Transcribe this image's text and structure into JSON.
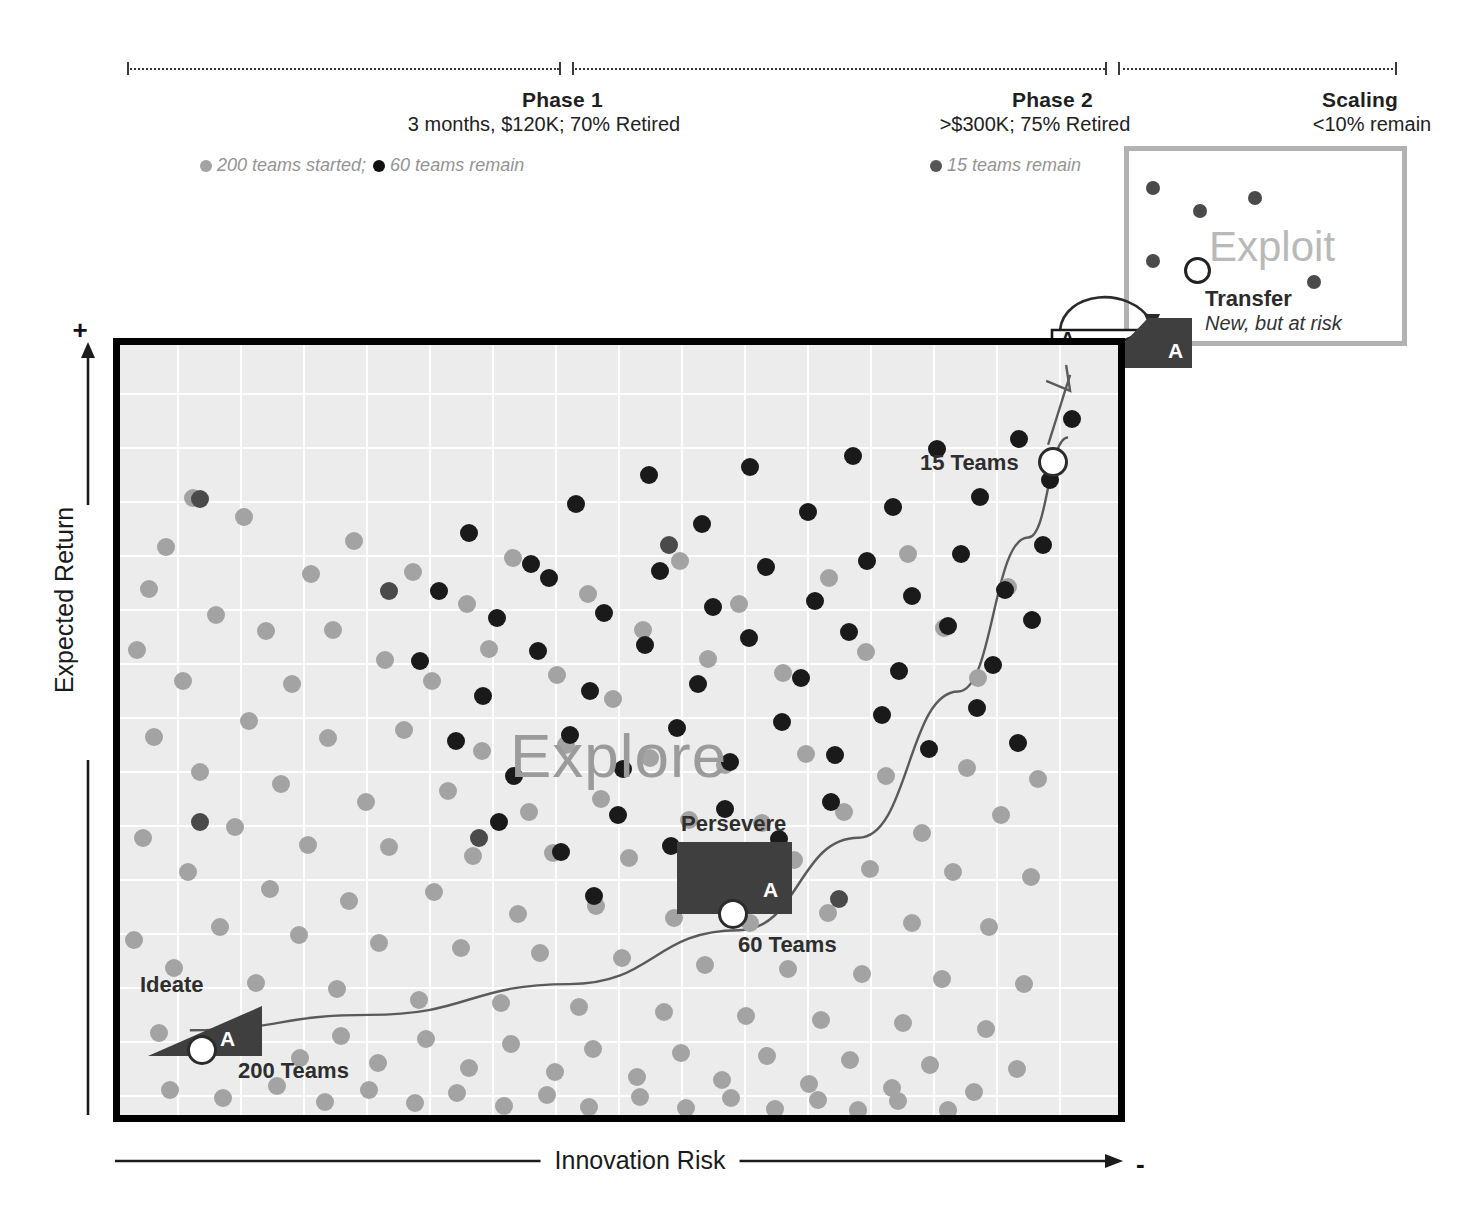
{
  "header": {
    "phases": [
      {
        "id": "phase-1",
        "title": "Phase 1",
        "subtitle": "3 months, $120K; 70% Retired",
        "note_gray": "200 teams started;",
        "note_black": "60 teams remain"
      },
      {
        "id": "phase-2",
        "title": "Phase 2",
        "subtitle": ">$300K; 75% Retired",
        "note_black": "15 teams remain"
      },
      {
        "id": "scaling",
        "title": "Scaling",
        "subtitle": "<10% remain"
      }
    ]
  },
  "axes": {
    "y_label": "Expected Return",
    "y_plus": "+",
    "x_label": "Innovation Risk",
    "x_minus": "-"
  },
  "plot": {
    "watermark": "Explore",
    "stages": [
      {
        "id": "ideate",
        "label": "Ideate",
        "marker_letter": "A",
        "count_label": "200 Teams"
      },
      {
        "id": "persevere",
        "label": "Persevere",
        "marker_letter": "A",
        "count_label": "60 Teams"
      },
      {
        "id": "pivot",
        "label": "15 Teams",
        "marker_letter": "A",
        "count_label": "15 Teams"
      }
    ]
  },
  "exploit_panel": {
    "watermark": "Exploit",
    "transfer_title": "Transfer",
    "transfer_subtitle": "New, but at risk",
    "marker_letter_white": "A",
    "marker_letter_dark": "A"
  },
  "colors": {
    "gray_dot": "#a3a3a3",
    "black_dot": "#1a1a1a",
    "dark_fill": "#3f3f3f",
    "plot_bg": "#ececec",
    "frame": "#000000",
    "panel_border": "#b2b2b2",
    "watermark": "#9b9b9b",
    "muted_text": "#949494"
  },
  "chart_data": {
    "type": "scatter",
    "xlabel": "Innovation Risk",
    "ylabel": "Expected Return",
    "xlim": [
      0,
      100
    ],
    "ylim": [
      0,
      100
    ],
    "grid": true,
    "legend_position": "top",
    "annotations": [
      "Phase 1 — 3 months, $120K; 70% Retired — 200 teams started; 60 teams remain",
      "Phase 2 — >$300K; 75% Retired — 15 teams remain",
      "Scaling — <10% remain",
      "Ideate: 200 Teams",
      "Persevere: 60 Teams",
      "Transfer: 15 Teams (New, but at risk)"
    ],
    "series": [
      {
        "name": "200 teams started",
        "color": "#a3a3a3",
        "count": 141,
        "points": [
          [
            7.3,
            80.1
          ],
          [
            4.6,
            73.8
          ],
          [
            12.4,
            77.7
          ],
          [
            2.9,
            68.3
          ],
          [
            9.6,
            64.9
          ],
          [
            1.7,
            60.4
          ],
          [
            14.6,
            62.9
          ],
          [
            6.3,
            56.4
          ],
          [
            19.1,
            70.3
          ],
          [
            17.2,
            56.0
          ],
          [
            23.4,
            74.6
          ],
          [
            21.3,
            63.0
          ],
          [
            29.4,
            70.5
          ],
          [
            26.6,
            59.1
          ],
          [
            34.8,
            66.4
          ],
          [
            31.3,
            56.3
          ],
          [
            39.4,
            72.3
          ],
          [
            37.0,
            60.5
          ],
          [
            43.8,
            57.1
          ],
          [
            46.9,
            67.6
          ],
          [
            52.4,
            63.0
          ],
          [
            49.4,
            54.0
          ],
          [
            56.1,
            72.0
          ],
          [
            58.9,
            59.2
          ],
          [
            62.0,
            66.3
          ],
          [
            66.4,
            57.4
          ],
          [
            71.0,
            69.7
          ],
          [
            74.7,
            60.1
          ],
          [
            79.0,
            72.8
          ],
          [
            82.6,
            63.3
          ],
          [
            86.0,
            56.7
          ],
          [
            89.0,
            68.6
          ],
          [
            3.4,
            49.1
          ],
          [
            8.0,
            44.6
          ],
          [
            12.9,
            51.2
          ],
          [
            16.1,
            43.0
          ],
          [
            20.8,
            48.9
          ],
          [
            24.6,
            40.6
          ],
          [
            28.5,
            50.0
          ],
          [
            32.9,
            42.1
          ],
          [
            36.3,
            47.3
          ],
          [
            41.0,
            39.4
          ],
          [
            44.7,
            48.1
          ],
          [
            48.2,
            41.0
          ],
          [
            53.1,
            46.4
          ],
          [
            57.0,
            38.3
          ],
          [
            60.6,
            45.5
          ],
          [
            64.3,
            37.9
          ],
          [
            68.7,
            46.9
          ],
          [
            72.5,
            39.4
          ],
          [
            76.8,
            44.0
          ],
          [
            80.4,
            36.6
          ],
          [
            84.9,
            45.1
          ],
          [
            88.3,
            38.9
          ],
          [
            92.0,
            43.7
          ],
          [
            2.3,
            36.0
          ],
          [
            6.8,
            31.5
          ],
          [
            11.5,
            37.4
          ],
          [
            15.0,
            29.4
          ],
          [
            18.8,
            35.1
          ],
          [
            22.9,
            27.8
          ],
          [
            27.0,
            34.8
          ],
          [
            31.5,
            28.9
          ],
          [
            35.4,
            33.7
          ],
          [
            39.9,
            26.1
          ],
          [
            43.4,
            34.0
          ],
          [
            47.7,
            27.1
          ],
          [
            51.0,
            33.4
          ],
          [
            55.5,
            25.6
          ],
          [
            59.4,
            32.6
          ],
          [
            63.1,
            25.0
          ],
          [
            67.5,
            33.1
          ],
          [
            70.9,
            26.2
          ],
          [
            75.2,
            32.0
          ],
          [
            79.4,
            24.9
          ],
          [
            83.5,
            31.5
          ],
          [
            87.1,
            24.4
          ],
          [
            91.3,
            30.9
          ],
          [
            1.4,
            22.7
          ],
          [
            5.4,
            19.1
          ],
          [
            10.0,
            24.4
          ],
          [
            13.6,
            17.2
          ],
          [
            17.9,
            23.4
          ],
          [
            21.7,
            16.4
          ],
          [
            26.0,
            22.3
          ],
          [
            30.0,
            15.0
          ],
          [
            34.2,
            21.7
          ],
          [
            38.2,
            14.6
          ],
          [
            42.1,
            21.1
          ],
          [
            46.0,
            14.0
          ],
          [
            50.3,
            20.4
          ],
          [
            54.5,
            13.4
          ],
          [
            58.6,
            19.5
          ],
          [
            62.7,
            12.9
          ],
          [
            66.9,
            19.0
          ],
          [
            70.2,
            12.4
          ],
          [
            74.3,
            18.3
          ],
          [
            78.5,
            11.9
          ],
          [
            82.4,
            17.6
          ],
          [
            86.8,
            11.2
          ],
          [
            90.6,
            17.0
          ],
          [
            3.9,
            10.6
          ],
          [
            8.6,
            8.2
          ],
          [
            13.1,
            11.1
          ],
          [
            18.0,
            7.4
          ],
          [
            22.1,
            10.2
          ],
          [
            25.9,
            6.8
          ],
          [
            30.7,
            9.9
          ],
          [
            35.0,
            6.1
          ],
          [
            39.2,
            9.2
          ],
          [
            43.6,
            5.6
          ],
          [
            47.4,
            8.6
          ],
          [
            51.8,
            5.0
          ],
          [
            56.2,
            8.1
          ],
          [
            60.3,
            4.5
          ],
          [
            64.8,
            7.6
          ],
          [
            69.0,
            4.0
          ],
          [
            73.1,
            7.1
          ],
          [
            77.4,
            3.5
          ],
          [
            81.2,
            6.5
          ],
          [
            85.6,
            3.0
          ],
          [
            89.9,
            6.0
          ],
          [
            5.0,
            3.2
          ],
          [
            10.3,
            2.2
          ],
          [
            15.7,
            3.8
          ],
          [
            20.5,
            1.7
          ],
          [
            24.9,
            3.2
          ],
          [
            29.6,
            1.5
          ],
          [
            33.8,
            2.9
          ],
          [
            38.5,
            1.2
          ],
          [
            42.8,
            2.6
          ],
          [
            47.0,
            1.0
          ],
          [
            52.1,
            2.4
          ],
          [
            56.7,
            0.9
          ],
          [
            61.2,
            2.2
          ],
          [
            65.6,
            0.8
          ],
          [
            69.9,
            2.0
          ],
          [
            73.9,
            0.7
          ],
          [
            78.0,
            1.8
          ],
          [
            83.0,
            0.6
          ]
        ]
      },
      {
        "name": "60 teams remain",
        "color": "#1a1a1a",
        "count": 60,
        "points": [
          [
            35.0,
            75.6
          ],
          [
            41.2,
            71.5
          ],
          [
            45.7,
            79.4
          ],
          [
            53.0,
            83.1
          ],
          [
            58.3,
            76.8
          ],
          [
            63.1,
            84.2
          ],
          [
            68.9,
            78.3
          ],
          [
            73.4,
            85.6
          ],
          [
            77.5,
            79.0
          ],
          [
            81.9,
            86.5
          ],
          [
            86.2,
            80.2
          ],
          [
            90.1,
            87.8
          ],
          [
            93.2,
            82.5
          ],
          [
            95.4,
            90.4
          ],
          [
            32.0,
            68.1
          ],
          [
            37.8,
            64.5
          ],
          [
            43.0,
            69.8
          ],
          [
            48.5,
            65.2
          ],
          [
            54.1,
            70.6
          ],
          [
            59.4,
            66.0
          ],
          [
            64.7,
            71.2
          ],
          [
            69.6,
            66.8
          ],
          [
            74.8,
            72.0
          ],
          [
            79.4,
            67.4
          ],
          [
            84.3,
            72.9
          ],
          [
            88.7,
            68.2
          ],
          [
            92.5,
            74.0
          ],
          [
            30.1,
            59.0
          ],
          [
            36.4,
            54.4
          ],
          [
            41.9,
            60.2
          ],
          [
            47.1,
            55.1
          ],
          [
            52.6,
            61.0
          ],
          [
            57.9,
            56.0
          ],
          [
            63.0,
            61.9
          ],
          [
            68.2,
            56.8
          ],
          [
            73.0,
            62.7
          ],
          [
            78.1,
            57.6
          ],
          [
            83.0,
            63.5
          ],
          [
            87.5,
            58.4
          ],
          [
            91.4,
            64.3
          ],
          [
            33.7,
            48.6
          ],
          [
            39.5,
            44.0
          ],
          [
            45.1,
            49.4
          ],
          [
            50.4,
            45.0
          ],
          [
            55.8,
            50.2
          ],
          [
            61.1,
            45.9
          ],
          [
            66.3,
            51.1
          ],
          [
            71.6,
            46.7
          ],
          [
            76.4,
            52.0
          ],
          [
            81.1,
            47.5
          ],
          [
            85.9,
            52.8
          ],
          [
            90.0,
            48.3
          ],
          [
            38.0,
            38.1
          ],
          [
            44.2,
            34.2
          ],
          [
            49.9,
            39.0
          ],
          [
            55.2,
            35.0
          ],
          [
            60.6,
            39.8
          ],
          [
            66.0,
            35.8
          ],
          [
            71.2,
            40.6
          ],
          [
            47.5,
            28.4
          ]
        ]
      },
      {
        "name": "15 teams remain (Exploit)",
        "color": "#4a4a4a",
        "count": 6,
        "points": [
          [
            8.0,
            80.0
          ],
          [
            27.0,
            68.0
          ],
          [
            55.0,
            74.0
          ],
          [
            8.0,
            38.0
          ],
          [
            72.0,
            28.0
          ],
          [
            36.0,
            36.0
          ]
        ]
      }
    ],
    "trend_curve": {
      "name": "funnel path",
      "color": "#5a5a5a",
      "description": "exponential rise from Ideate (lower-left) to Transfer (upper-right)",
      "points": [
        [
          7,
          11
        ],
        [
          25,
          13
        ],
        [
          45,
          17
        ],
        [
          62,
          24
        ],
        [
          74,
          36
        ],
        [
          84,
          55
        ],
        [
          91,
          75
        ],
        [
          95,
          88
        ]
      ]
    },
    "milestone_markers": [
      {
        "label": "200 Teams",
        "x": 7,
        "y": 11
      },
      {
        "label": "60 Teams",
        "x": 62,
        "y": 27
      },
      {
        "label": "15 Teams",
        "x": 93,
        "y": 85
      }
    ]
  }
}
